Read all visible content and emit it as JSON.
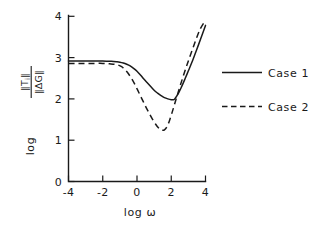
{
  "chart_data": {
    "type": "line",
    "title": "",
    "xlabel": "log ω",
    "ylabel_prefix": "log",
    "ylabel_numerator": "‖T",
    "ylabel_numerator_sub": "i",
    "ylabel_numerator_tail": "‖",
    "ylabel_denominator": "‖ΔG‖",
    "xlim": [
      -4,
      4
    ],
    "ylim": [
      0,
      4
    ],
    "xticks": [
      -4,
      -2,
      0,
      2,
      4
    ],
    "xtick_labels": [
      "-4",
      "-2",
      "0",
      "2",
      "4"
    ],
    "yticks": [
      0,
      1,
      2,
      3,
      4
    ],
    "ytick_labels": [
      "0",
      "1",
      "2",
      "3",
      "4"
    ],
    "grid": false,
    "legend_position": "right",
    "series": [
      {
        "name": "Case 1",
        "style": "solid",
        "x": [
          -4.0,
          -3.5,
          -3.0,
          -2.5,
          -2.0,
          -1.5,
          -1.2,
          -1.0,
          -0.8,
          -0.6,
          -0.4,
          -0.2,
          0.0,
          0.2,
          0.4,
          0.6,
          0.8,
          1.0,
          1.2,
          1.4,
          1.6,
          1.8,
          2.0,
          2.1,
          2.2,
          2.4,
          2.6,
          2.8,
          3.0,
          3.2,
          3.4,
          3.6,
          3.8,
          4.0
        ],
        "y": [
          2.92,
          2.92,
          2.92,
          2.92,
          2.92,
          2.91,
          2.9,
          2.89,
          2.87,
          2.84,
          2.8,
          2.74,
          2.67,
          2.58,
          2.48,
          2.39,
          2.3,
          2.21,
          2.14,
          2.08,
          2.03,
          2.0,
          1.98,
          1.98,
          2.0,
          2.12,
          2.29,
          2.48,
          2.68,
          2.88,
          3.1,
          3.32,
          3.55,
          3.78
        ]
      },
      {
        "name": "Case 2",
        "style": "dashed",
        "x": [
          -4.0,
          -3.5,
          -3.0,
          -2.5,
          -2.0,
          -1.6,
          -1.3,
          -1.1,
          -0.9,
          -0.7,
          -0.5,
          -0.3,
          -0.1,
          0.1,
          0.3,
          0.5,
          0.7,
          0.9,
          1.1,
          1.25,
          1.4,
          1.5,
          1.6,
          1.75,
          1.9,
          2.1,
          2.3,
          2.5,
          2.7,
          2.9,
          3.1,
          3.3,
          3.5,
          3.7,
          3.9,
          4.0
        ],
        "y": [
          2.86,
          2.86,
          2.86,
          2.86,
          2.86,
          2.85,
          2.84,
          2.82,
          2.78,
          2.71,
          2.61,
          2.48,
          2.33,
          2.16,
          1.99,
          1.82,
          1.66,
          1.51,
          1.38,
          1.3,
          1.25,
          1.24,
          1.25,
          1.33,
          1.48,
          1.74,
          2.02,
          2.29,
          2.55,
          2.8,
          3.04,
          3.27,
          3.5,
          3.7,
          3.84,
          3.9
        ]
      }
    ],
    "legend": [
      {
        "label": "Case 1",
        "style": "solid"
      },
      {
        "label": "Case 2",
        "style": "dashed"
      }
    ],
    "colors": {
      "ink": "#1a1a1a",
      "background": "#ffffff"
    }
  }
}
